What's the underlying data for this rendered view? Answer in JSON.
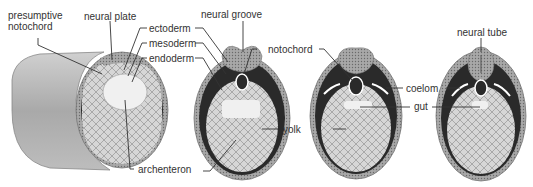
{
  "diagram": {
    "labels": {
      "presumptive_notochord": "presumptive\nnotochord",
      "presumptive_line1": "presumptive",
      "presumptive_line2": "notochord",
      "neural_plate": "neural plate",
      "ectoderm": "ectoderm",
      "mesoderm": "mesoderm",
      "endoderm": "endoderm",
      "archenteron": "archenteron",
      "neural_groove": "neural groove",
      "notochord": "notochord",
      "yolk": "yolk",
      "coelom": "coelom",
      "gut": "gut",
      "neural_tube": "neural tube"
    },
    "colors": {
      "dark_mesoderm": "#2a2a2a",
      "ectoderm_gray": "#9a9a9a",
      "yolk_light": "#d8d8d8",
      "cylinder": "#b8b8b8",
      "label_text": "#333333",
      "leader_line": "#333333"
    }
  }
}
